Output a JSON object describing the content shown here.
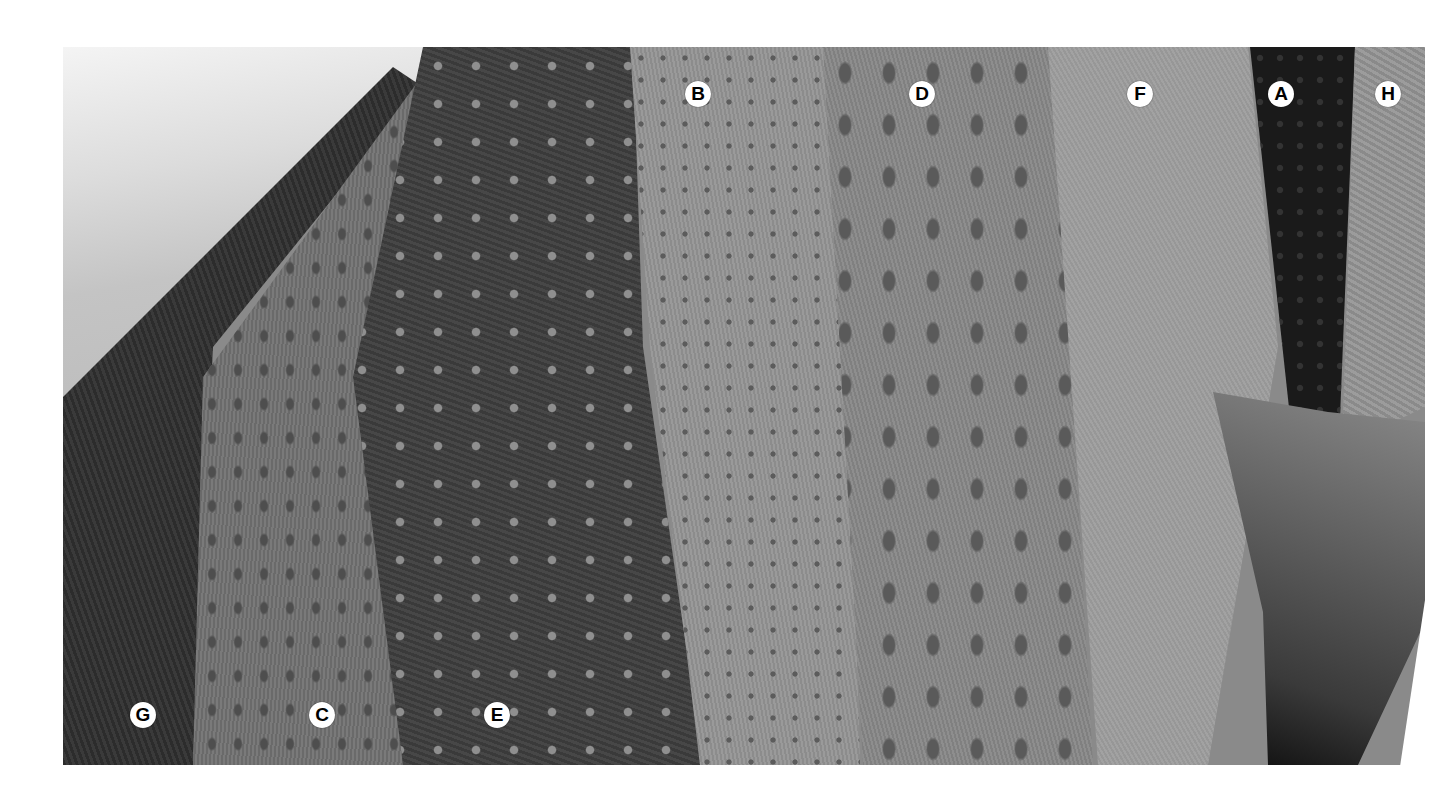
{
  "image": {
    "description": "Grayscale photograph of eight textured fabric/weave swatches draped side by side, each marked with a lettered circle",
    "background_color": "#ffffff",
    "label_fill": "#ffffff",
    "label_text_color": "#000000"
  },
  "labels": [
    {
      "letter": "B",
      "swatch": "light gray, small dotted texture"
    },
    {
      "letter": "D",
      "swatch": "medium gray, large leaf/scale texture"
    },
    {
      "letter": "F",
      "swatch": "light gray, fine diagonal texture"
    },
    {
      "letter": "A",
      "swatch": "near-black, diamond texture"
    },
    {
      "letter": "H",
      "swatch": "light gray, crackled texture"
    },
    {
      "letter": "G",
      "swatch": "dark gray, fine textured"
    },
    {
      "letter": "C",
      "swatch": "medium gray, scale texture"
    },
    {
      "letter": "E",
      "swatch": "dark gray with light dots"
    }
  ]
}
